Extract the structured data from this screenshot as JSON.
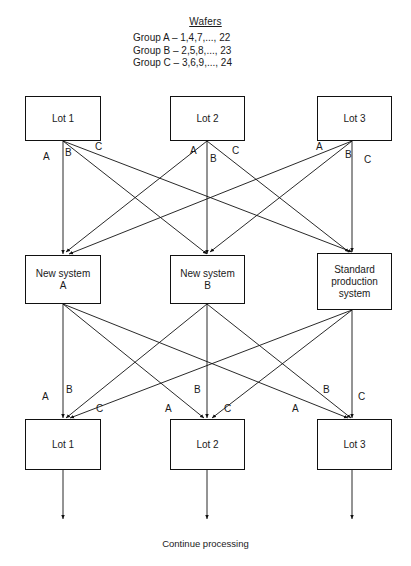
{
  "header": {
    "title": "Wafers",
    "groups": [
      "Group A – 1,4,7,..., 22",
      "Group B – 2,5,8,..., 23",
      "Group C – 3,6,9,..., 24"
    ]
  },
  "nodes": {
    "top": [
      {
        "id": "top-lot-1",
        "label": "Lot 1"
      },
      {
        "id": "top-lot-2",
        "label": "Lot 2"
      },
      {
        "id": "top-lot-3",
        "label": "Lot 3"
      }
    ],
    "middle": [
      {
        "id": "system-new-a",
        "label": "New system\nA"
      },
      {
        "id": "system-new-b",
        "label": "New system\nB"
      },
      {
        "id": "system-standard",
        "label": "Standard\nproduction\nsystem"
      }
    ],
    "bottom": [
      {
        "id": "bottom-lot-1",
        "label": "Lot 1"
      },
      {
        "id": "bottom-lot-2",
        "label": "Lot 2"
      },
      {
        "id": "bottom-lot-3",
        "label": "Lot 3"
      }
    ]
  },
  "edge_labels": {
    "top_row": [
      {
        "text": "A",
        "x": 43,
        "y": 152
      },
      {
        "text": "B",
        "x": 65,
        "y": 148
      },
      {
        "text": "C",
        "x": 95,
        "y": 142
      },
      {
        "text": "A",
        "x": 190,
        "y": 146
      },
      {
        "text": "B",
        "x": 210,
        "y": 154
      },
      {
        "text": "C",
        "x": 232,
        "y": 146
      },
      {
        "text": "A",
        "x": 316,
        "y": 142
      },
      {
        "text": "B",
        "x": 345,
        "y": 150
      },
      {
        "text": "C",
        "x": 364,
        "y": 155
      }
    ],
    "bottom_row": [
      {
        "text": "A",
        "x": 42,
        "y": 392
      },
      {
        "text": "B",
        "x": 66,
        "y": 385
      },
      {
        "text": "C",
        "x": 96,
        "y": 404
      },
      {
        "text": "A",
        "x": 165,
        "y": 404
      },
      {
        "text": "B",
        "x": 194,
        "y": 385
      },
      {
        "text": "C",
        "x": 224,
        "y": 404
      },
      {
        "text": "A",
        "x": 292,
        "y": 404
      },
      {
        "text": "B",
        "x": 323,
        "y": 385
      },
      {
        "text": "C",
        "x": 358,
        "y": 392
      }
    ]
  },
  "footer": {
    "text": "Continue processing"
  },
  "colors": {
    "stroke": "#111111",
    "text": "#1a1a1a",
    "background": "#ffffff"
  },
  "chart_data": {
    "type": "diagram",
    "title": "Wafers",
    "stages": [
      {
        "name": "input-lots",
        "nodes": [
          "Lot 1",
          "Lot 2",
          "Lot 3"
        ]
      },
      {
        "name": "systems",
        "nodes": [
          "New system A",
          "New system B",
          "Standard production system"
        ]
      },
      {
        "name": "output-lots",
        "nodes": [
          "Lot 1",
          "Lot 2",
          "Lot 3"
        ]
      }
    ],
    "group_assignments": [
      {
        "group": "A",
        "wafers": "1,4,7,..., 22"
      },
      {
        "group": "B",
        "wafers": "2,5,8,..., 23"
      },
      {
        "group": "C",
        "wafers": "3,6,9,..., 24"
      }
    ],
    "edges_stage1": [
      {
        "from": "Lot 1",
        "to": "New system A",
        "label": "A"
      },
      {
        "from": "Lot 1",
        "to": "New system B",
        "label": "B"
      },
      {
        "from": "Lot 1",
        "to": "Standard production system",
        "label": "C"
      },
      {
        "from": "Lot 2",
        "to": "New system A",
        "label": "A"
      },
      {
        "from": "Lot 2",
        "to": "New system B",
        "label": "B"
      },
      {
        "from": "Lot 2",
        "to": "Standard production system",
        "label": "C"
      },
      {
        "from": "Lot 3",
        "to": "New system A",
        "label": "A"
      },
      {
        "from": "Lot 3",
        "to": "New system B",
        "label": "B"
      },
      {
        "from": "Lot 3",
        "to": "Standard production system",
        "label": "C"
      }
    ],
    "edges_stage2": [
      {
        "from": "New system A",
        "to": "Lot 1",
        "label": "A"
      },
      {
        "from": "New system A",
        "to": "Lot 2",
        "label": "A"
      },
      {
        "from": "New system A",
        "to": "Lot 3",
        "label": "A"
      },
      {
        "from": "New system B",
        "to": "Lot 1",
        "label": "B"
      },
      {
        "from": "New system B",
        "to": "Lot 2",
        "label": "B"
      },
      {
        "from": "New system B",
        "to": "Lot 3",
        "label": "B"
      },
      {
        "from": "Standard production system",
        "to": "Lot 1",
        "label": "C"
      },
      {
        "from": "Standard production system",
        "to": "Lot 2",
        "label": "C"
      },
      {
        "from": "Standard production system",
        "to": "Lot 3",
        "label": "C"
      }
    ],
    "exit_label": "Continue processing"
  }
}
